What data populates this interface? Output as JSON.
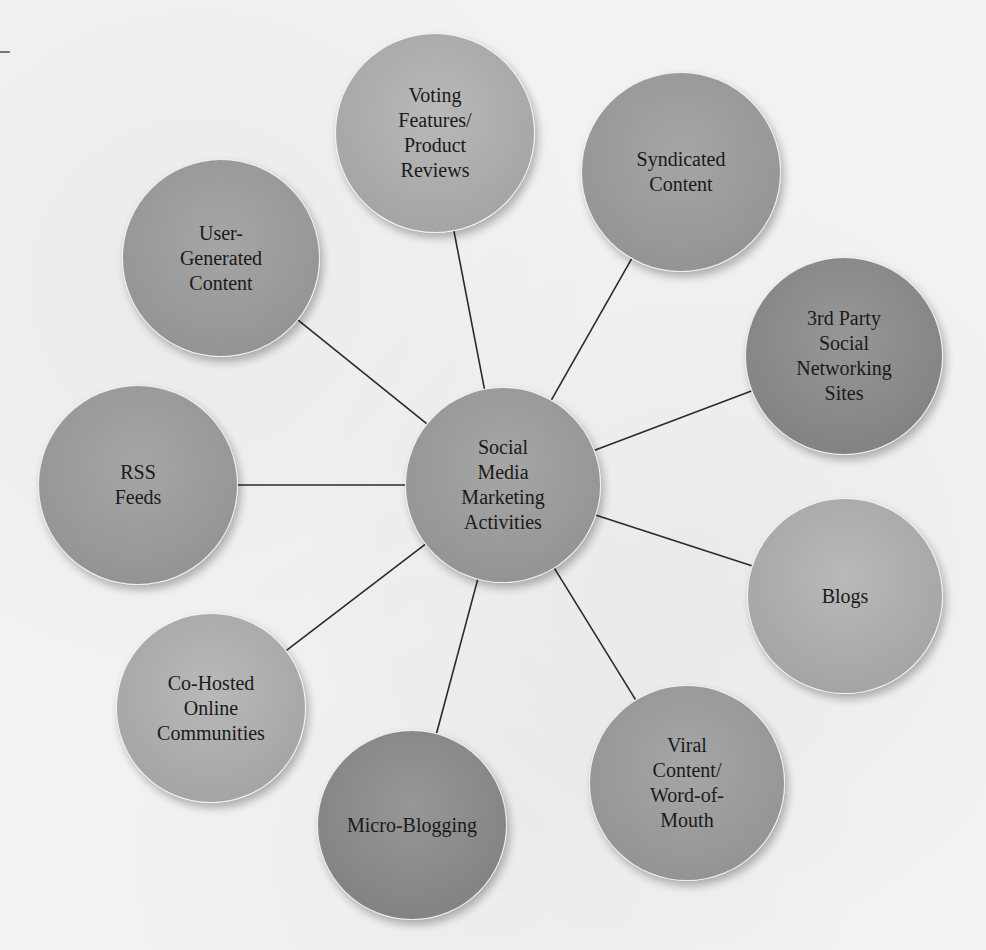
{
  "diagram": {
    "type": "hub-and-spoke",
    "center": {
      "label": "Social\nMedia\nMarketing\nActivities",
      "cx": 503,
      "cy": 485,
      "r": 98,
      "shade": "mid"
    },
    "nodes": [
      {
        "id": "voting",
        "label": "Voting\nFeatures/\nProduct\nReviews",
        "cx": 435,
        "cy": 133,
        "r": 100,
        "shade": "light"
      },
      {
        "id": "syndicated",
        "label": "Syndicated\nContent",
        "cx": 681,
        "cy": 172,
        "r": 100,
        "shade": "mid"
      },
      {
        "id": "third-party",
        "label": "3rd Party\nSocial\nNetworking\nSites",
        "cx": 844,
        "cy": 356,
        "r": 99,
        "shade": "dark"
      },
      {
        "id": "blogs",
        "label": "Blogs",
        "cx": 845,
        "cy": 596,
        "r": 98,
        "shade": "light"
      },
      {
        "id": "viral",
        "label": "Viral\nContent/\nWord-of-\nMouth",
        "cx": 687,
        "cy": 783,
        "r": 98,
        "shade": "mid"
      },
      {
        "id": "micro-blogging",
        "label": "Micro-Blogging",
        "cx": 412,
        "cy": 825,
        "r": 95,
        "shade": "dark"
      },
      {
        "id": "co-hosted",
        "label": "Co-Hosted\nOnline\nCommunities",
        "cx": 211,
        "cy": 708,
        "r": 95,
        "shade": "light"
      },
      {
        "id": "rss",
        "label": "RSS\nFeeds",
        "cx": 138,
        "cy": 485,
        "r": 100,
        "shade": "mid"
      },
      {
        "id": "user-generated",
        "label": "User-\nGenerated\nContent",
        "cx": 221,
        "cy": 258,
        "r": 99,
        "shade": "mid"
      }
    ],
    "colors": {
      "background": "#f2f2f0",
      "line": "#2a2a2a",
      "text": "#1a1a1a"
    }
  }
}
